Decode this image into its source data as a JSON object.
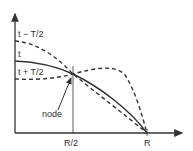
{
  "diagram": {
    "curves": [
      {
        "label": "t − T/2",
        "style": "dashed"
      },
      {
        "label": "t",
        "style": "solid"
      },
      {
        "label": "t + T/2",
        "style": "dashed"
      }
    ],
    "annotation": "node",
    "x_ticks": [
      "R/2",
      "R"
    ],
    "colors": {
      "ink": "#333333",
      "background": "#ffffff"
    }
  }
}
